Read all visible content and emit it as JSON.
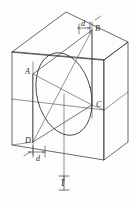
{
  "figure": {
    "type": "technical-line-drawing",
    "stroke_color": "#3a3a3a",
    "background_color": "#fdfdfd",
    "labels": {
      "point_a": "A",
      "point_b": "B",
      "point_c": "C",
      "point_d": "D",
      "dim_top": "d",
      "dim_bottom": "d",
      "bottom_marker": "I"
    },
    "geometry": {
      "front_face": [
        {
          "x": 12,
          "y": 52
        },
        {
          "x": 12,
          "y": 145
        },
        {
          "x": 104,
          "y": 160
        },
        {
          "x": 104,
          "y": 30
        }
      ],
      "top_face": [
        {
          "x": 12,
          "y": 52
        },
        {
          "x": 66,
          "y": 12
        },
        {
          "x": 128,
          "y": 42
        },
        {
          "x": 104,
          "y": 30
        }
      ],
      "hidden_back_corner": {
        "x": 128,
        "y": 150
      },
      "ellipse": {
        "center": {
          "x": 64,
          "y": 94
        },
        "rx": 27,
        "ry": 42,
        "rotation_deg": -14
      },
      "point_coords": {
        "A": {
          "x": 33,
          "y": 74
        },
        "B": {
          "x": 92,
          "y": 30
        },
        "C": {
          "x": 92,
          "y": 105
        },
        "D": {
          "x": 33,
          "y": 142
        }
      },
      "vertical_axis": {
        "x": 64,
        "y_top": 94,
        "y_bottom": 182
      }
    }
  }
}
